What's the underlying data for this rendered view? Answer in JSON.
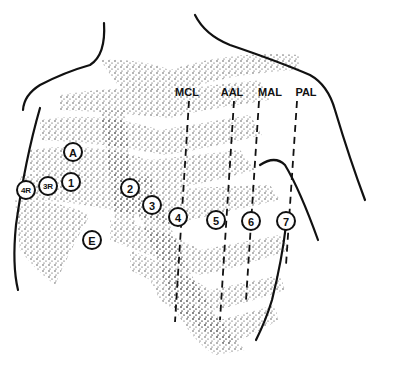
{
  "figure": {
    "colors": {
      "ink": "#111111",
      "background": "#ffffff",
      "stipple": "#333333"
    }
  },
  "reference_lines": [
    {
      "id": "mcl",
      "label": "MCL",
      "lx": 187,
      "ly": 96,
      "x1": 189,
      "y1": 101,
      "x2": 175,
      "y2": 322
    },
    {
      "id": "aal",
      "label": "AAL",
      "lx": 232,
      "ly": 96,
      "x1": 234,
      "y1": 101,
      "x2": 220,
      "y2": 320
    },
    {
      "id": "mal",
      "label": "MAL",
      "lx": 270,
      "ly": 96,
      "x1": 259,
      "y1": 101,
      "x2": 246,
      "y2": 300
    },
    {
      "id": "pal",
      "label": "PAL",
      "lx": 306,
      "ly": 96,
      "x1": 297,
      "y1": 101,
      "x2": 286,
      "y2": 265
    }
  ],
  "electrodes": [
    {
      "id": "A",
      "label": "A",
      "cx": 73,
      "cy": 152,
      "r": 9
    },
    {
      "id": "1",
      "label": "1",
      "cx": 71,
      "cy": 182,
      "r": 9
    },
    {
      "id": "3R",
      "label": "3R",
      "cx": 48,
      "cy": 186,
      "r": 9
    },
    {
      "id": "4R",
      "label": "4R",
      "cx": 26,
      "cy": 190,
      "r": 9
    },
    {
      "id": "2",
      "label": "2",
      "cx": 130,
      "cy": 188,
      "r": 9
    },
    {
      "id": "3",
      "label": "3",
      "cx": 152,
      "cy": 205,
      "r": 9
    },
    {
      "id": "4",
      "label": "4",
      "cx": 178,
      "cy": 217,
      "r": 9
    },
    {
      "id": "5",
      "label": "5",
      "cx": 216,
      "cy": 220,
      "r": 9
    },
    {
      "id": "6",
      "label": "6",
      "cx": 251,
      "cy": 221,
      "r": 9
    },
    {
      "id": "7",
      "label": "7",
      "cx": 286,
      "cy": 221,
      "r": 9
    },
    {
      "id": "E",
      "label": "E",
      "cx": 92,
      "cy": 240,
      "r": 9
    }
  ]
}
